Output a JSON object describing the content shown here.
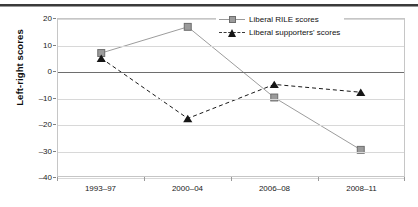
{
  "chart_data": {
    "type": "line",
    "title": "",
    "xlabel": "",
    "ylabel": "Left-right scores",
    "categories": [
      "1993-97",
      "2000-04",
      "2006-08",
      "2008-11"
    ],
    "ylim": [
      -40,
      20
    ],
    "yticks": [
      20,
      10,
      0,
      -10,
      -20,
      -30,
      -40
    ],
    "ytick_labels": [
      "20",
      "10",
      "0",
      "-10",
      "-20",
      "-30",
      "-40"
    ],
    "grid": true,
    "zero_line": true,
    "legend_position": "top-right",
    "series": [
      {
        "name": "Liberal RILE scores",
        "values": [
          7,
          17,
          -10,
          -30
        ],
        "marker": "square",
        "line_style": "solid",
        "color": "#9b9b9b"
      },
      {
        "name": "Liberal supporters' scores",
        "values": [
          5,
          -18,
          -5,
          -8
        ],
        "marker": "triangle",
        "line_style": "dashed",
        "color": "#161616"
      }
    ]
  },
  "legend": {
    "items": [
      {
        "label": "Liberal RILE scores"
      },
      {
        "label": "Liberal supporters' scores"
      }
    ]
  },
  "axes": {
    "y_title": "Left-right scores"
  }
}
